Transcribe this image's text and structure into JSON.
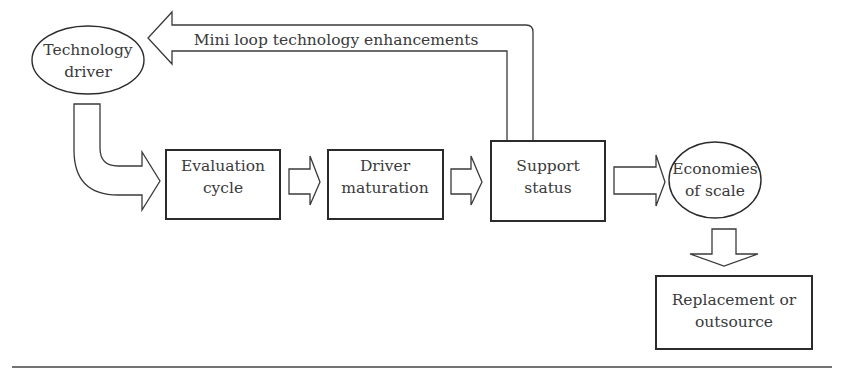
{
  "diagram": {
    "nodes": {
      "technology_driver": {
        "line1": "Technology",
        "line2": "driver",
        "shape": "ellipse"
      },
      "evaluation_cycle": {
        "line1": "Evaluation",
        "line2": "cycle",
        "shape": "rectangle"
      },
      "driver_maturation": {
        "line1": "Driver",
        "line2": "maturation",
        "shape": "rectangle"
      },
      "support_status": {
        "line1": "Support",
        "line2": "status",
        "shape": "rectangle"
      },
      "economies_of_scale": {
        "line1": "Economies",
        "line2": "of scale",
        "shape": "ellipse"
      },
      "replacement_or_outsource": {
        "line1": "Replacement or",
        "line2": "outsource",
        "shape": "rectangle"
      }
    },
    "edges": [
      {
        "from": "technology_driver",
        "to": "evaluation_cycle",
        "style": "curved-block-arrow"
      },
      {
        "from": "evaluation_cycle",
        "to": "driver_maturation",
        "style": "block-arrow"
      },
      {
        "from": "driver_maturation",
        "to": "support_status",
        "style": "block-arrow"
      },
      {
        "from": "support_status",
        "to": "economies_of_scale",
        "style": "block-arrow"
      },
      {
        "from": "economies_of_scale",
        "to": "replacement_or_outsource",
        "style": "block-arrow-down"
      },
      {
        "from": "support_status",
        "to": "technology_driver",
        "style": "loop-block-arrow",
        "label": "Mini loop technology enhancements"
      }
    ],
    "loop_label": "Mini loop technology enhancements"
  }
}
